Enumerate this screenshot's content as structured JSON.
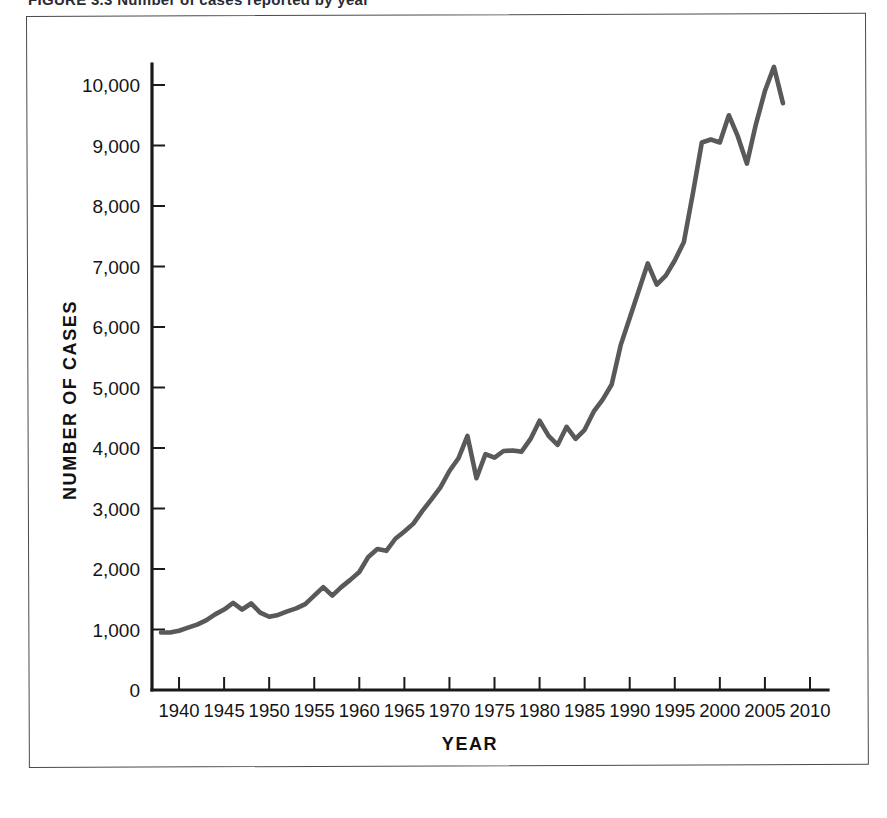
{
  "figure": {
    "caption": "FIGURE 3.3    Number of cases reported by year"
  },
  "chart_data": {
    "type": "line",
    "title": "",
    "subtitle": "",
    "xlabel": "YEAR",
    "ylabel": "NUMBER OF CASES",
    "xlim": [
      1937,
      2012
    ],
    "ylim": [
      0,
      10800
    ],
    "grid": false,
    "legend": null,
    "legend_position": "none",
    "line_color": "#595959",
    "axis_color": "#1a1a1a",
    "background_color": "#ffffff",
    "xticks": [
      1940,
      1945,
      1950,
      1955,
      1960,
      1965,
      1970,
      1975,
      1980,
      1985,
      1990,
      1995,
      2000,
      2005,
      2010
    ],
    "xtick_labels": [
      "1940",
      "1945",
      "1950",
      "1955",
      "1960",
      "1965",
      "1970",
      "1975",
      "1980",
      "1985",
      "1990",
      "1995",
      "2000",
      "2005",
      "2010"
    ],
    "yticks": [
      0,
      1000,
      2000,
      3000,
      4000,
      5000,
      6000,
      7000,
      8000,
      9000,
      10000
    ],
    "ytick_labels": [
      "0",
      "1,000",
      "2,000",
      "3,000",
      "4,000",
      "5,000",
      "6,000",
      "7,000",
      "8,000",
      "9,000",
      "10,000"
    ],
    "x": [
      1938,
      1939,
      1940,
      1941,
      1942,
      1943,
      1944,
      1945,
      1946,
      1947,
      1948,
      1949,
      1950,
      1951,
      1952,
      1953,
      1954,
      1955,
      1956,
      1957,
      1958,
      1959,
      1960,
      1961,
      1962,
      1963,
      1964,
      1965,
      1966,
      1967,
      1968,
      1969,
      1970,
      1971,
      1972,
      1973,
      1974,
      1975,
      1976,
      1977,
      1978,
      1979,
      1980,
      1981,
      1982,
      1983,
      1984,
      1985,
      1986,
      1987,
      1988,
      1989,
      1990,
      1991,
      1992,
      1993,
      1994,
      1995,
      1996,
      1997,
      1998,
      1999,
      2000,
      2001,
      2002,
      2003,
      2004,
      2005,
      2006,
      2007
    ],
    "values": [
      950,
      950,
      980,
      1030,
      1080,
      1150,
      1250,
      1330,
      1440,
      1330,
      1430,
      1280,
      1210,
      1240,
      1300,
      1350,
      1420,
      1560,
      1700,
      1560,
      1700,
      1820,
      1950,
      2200,
      2330,
      2300,
      2500,
      2620,
      2750,
      2960,
      3150,
      3350,
      3620,
      3830,
      4200,
      3500,
      3900,
      3840,
      3950,
      3960,
      3940,
      4150,
      4450,
      4200,
      4050,
      4350,
      4150,
      4300,
      4600,
      4800,
      5050,
      5700,
      6150,
      6600,
      7050,
      6700,
      6850,
      7100,
      7400,
      8200,
      9050,
      9100,
      9050,
      9500,
      9150,
      8700,
      9350,
      9900,
      10300,
      9700
    ],
    "series": [
      {
        "name": "Number of cases",
        "values": [
          950,
          950,
          980,
          1030,
          1080,
          1150,
          1250,
          1330,
          1440,
          1330,
          1430,
          1280,
          1210,
          1240,
          1300,
          1350,
          1420,
          1560,
          1700,
          1560,
          1700,
          1820,
          1950,
          2200,
          2330,
          2300,
          2500,
          2620,
          2750,
          2960,
          3150,
          3350,
          3620,
          3830,
          4200,
          3500,
          3900,
          3840,
          3950,
          3960,
          3940,
          4150,
          4450,
          4200,
          4050,
          4350,
          4150,
          4300,
          4600,
          4800,
          5050,
          5700,
          6150,
          6600,
          7050,
          6700,
          6850,
          7100,
          7400,
          8200,
          9050,
          9100,
          9050,
          9500,
          9150,
          8700,
          9350,
          9900,
          10300,
          9700
        ]
      }
    ],
    "annotations": []
  }
}
